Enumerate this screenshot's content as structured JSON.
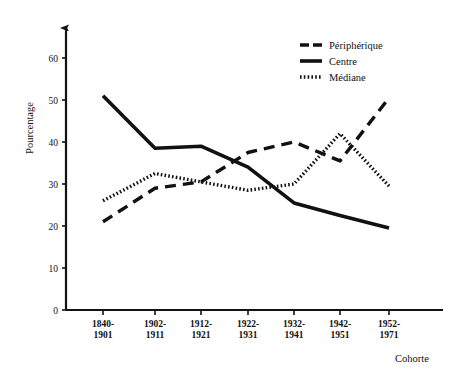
{
  "chart_data": {
    "type": "line",
    "title": "",
    "xlabel": "Cohorte",
    "ylabel": "Pourcentage",
    "ylim": [
      0,
      65
    ],
    "yticks": [
      "0",
      "10",
      "20",
      "30",
      "40",
      "50",
      "60"
    ],
    "grid": false,
    "legend_position": "top-right",
    "categories": [
      "1840-\n1901",
      "1902-\n1911",
      "1912-\n1921",
      "1922-\n1931",
      "1932-\n1941",
      "1942-\n1951",
      "1952-\n1971"
    ],
    "category_lines": [
      [
        "1840-",
        "1901"
      ],
      [
        "1902-",
        "1911"
      ],
      [
        "1912-",
        "1921"
      ],
      [
        "1922-",
        "1931"
      ],
      [
        "1932-",
        "1941"
      ],
      [
        "1942-",
        "1951"
      ],
      [
        "1952-",
        "1971"
      ]
    ],
    "series": [
      {
        "name": "Périphérique",
        "style": "dashed",
        "color": "#111111",
        "values": [
          21.0,
          29.0,
          30.5,
          37.5,
          40.0,
          35.5,
          50.5
        ]
      },
      {
        "name": "Centre",
        "style": "solid",
        "color": "#111111",
        "values": [
          51.0,
          38.5,
          39.0,
          34.0,
          25.5,
          22.5,
          19.5
        ]
      },
      {
        "name": "Médiane",
        "style": "dotted",
        "color": "#111111",
        "values": [
          26.0,
          32.5,
          30.5,
          28.5,
          30.0,
          42.0,
          29.5
        ]
      }
    ]
  },
  "legend": {
    "items": [
      {
        "label": "Périphérique",
        "style": "dashed"
      },
      {
        "label": "Centre",
        "style": "solid"
      },
      {
        "label": "Médiane",
        "style": "dotted"
      }
    ]
  },
  "axes": {
    "y_title": "Pourcentage",
    "x_title": "Cohorte"
  }
}
